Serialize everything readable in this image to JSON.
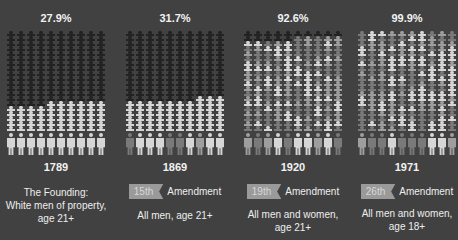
{
  "colors": {
    "background": "#414141",
    "not_eligible": "#222222",
    "eligible_light": "#d6d6d6",
    "eligible_mid": "#9e9e9e",
    "eligible_dark": "#7a7a7a",
    "badge": "#9a9a9a"
  },
  "panels": [
    {
      "percent": "27.9%",
      "year": "1789",
      "amendment": null,
      "caption_lines": [
        "The Founding:",
        "White men of property,",
        "age 21+"
      ]
    },
    {
      "percent": "31.7%",
      "year": "1869",
      "amendment": {
        "badge": "15th",
        "label": "Amendment"
      },
      "caption_lines": [
        "All men, age 21+"
      ]
    },
    {
      "percent": "92.6%",
      "year": "1920",
      "amendment": {
        "badge": "19th",
        "label": "Amendment"
      },
      "caption_lines": [
        "All men and women,",
        "age 21+"
      ]
    },
    {
      "percent": "99.9%",
      "year": "1971",
      "amendment": {
        "badge": "26th",
        "label": "Amendment"
      },
      "caption_lines": [
        "All men and women,",
        "age 18+"
      ]
    }
  ],
  "chart_data": {
    "type": "pictogram",
    "title": "",
    "categories": [
      "1789",
      "1869",
      "1920",
      "1971"
    ],
    "series": [
      {
        "name": "Share of population eligible to vote (%)",
        "values": [
          27.9,
          31.7,
          92.6,
          99.9
        ]
      }
    ],
    "labels": [
      "The Founding: White men of property, age 21+",
      "15th Amendment — All men, age 21+",
      "19th Amendment — All men and women, age 21+",
      "26th Amendment — All men and women, age 18+"
    ],
    "grid": {
      "columns": 10,
      "small_rows": 20,
      "large_row": 1
    },
    "legend": "dark icons = not eligible; light/gray icons = eligible"
  }
}
